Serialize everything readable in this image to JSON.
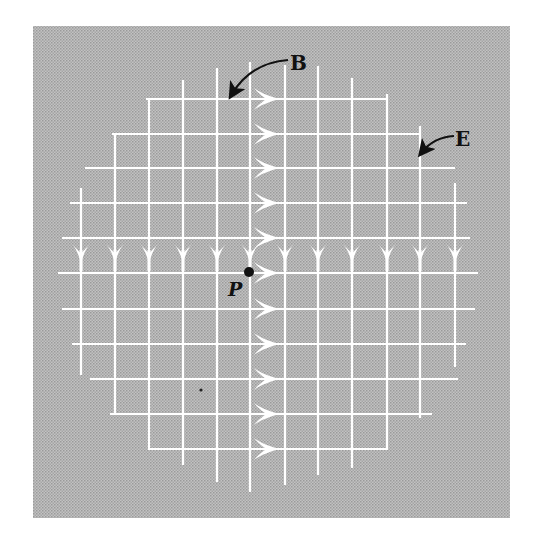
{
  "figure": {
    "background": "#b4b4b4",
    "grid_color": "#ffffff",
    "annotation_color": "#111111",
    "box": {
      "x": 33,
      "y": 26,
      "w": 477,
      "h": 492
    },
    "labels": {
      "magnetic_field": "B",
      "electric_field": "E",
      "point": "P"
    },
    "columns": [
      {
        "x": 81,
        "y1": 188,
        "y2": 375
      },
      {
        "x": 115,
        "y1": 135,
        "y2": 415
      },
      {
        "x": 149,
        "y1": 100,
        "y2": 450
      },
      {
        "x": 183,
        "y1": 80,
        "y2": 465
      },
      {
        "x": 217,
        "y1": 68,
        "y2": 482
      },
      {
        "x": 250,
        "y1": 62,
        "y2": 492
      },
      {
        "x": 285,
        "y1": 65,
        "y2": 485
      },
      {
        "x": 318,
        "y1": 66,
        "y2": 475
      },
      {
        "x": 352,
        "y1": 78,
        "y2": 468
      },
      {
        "x": 387,
        "y1": 94,
        "y2": 450
      },
      {
        "x": 420,
        "y1": 126,
        "y2": 418
      },
      {
        "x": 455,
        "y1": 183,
        "y2": 367
      }
    ],
    "rows": [
      {
        "y": 99,
        "x1": 146,
        "x2": 386
      },
      {
        "y": 134,
        "x1": 112,
        "x2": 421
      },
      {
        "y": 168,
        "x1": 85,
        "x2": 455
      },
      {
        "y": 203,
        "x1": 70,
        "x2": 467
      },
      {
        "y": 238,
        "x1": 62,
        "x2": 470
      },
      {
        "y": 273,
        "x1": 58,
        "x2": 478
      },
      {
        "y": 309,
        "x1": 62,
        "x2": 475
      },
      {
        "y": 344,
        "x1": 72,
        "x2": 466
      },
      {
        "y": 379,
        "x1": 90,
        "x2": 458
      },
      {
        "y": 414,
        "x1": 110,
        "x2": 432
      },
      {
        "y": 449,
        "x1": 150,
        "x2": 388
      }
    ],
    "right_arrows": {
      "base_x": 254,
      "tip_x": 280,
      "rows": [
        99,
        134,
        168,
        203,
        238,
        273,
        309,
        344,
        379,
        414,
        449
      ]
    },
    "down_arrows": {
      "top_y": 244,
      "tip_y": 263,
      "cols": [
        81,
        115,
        149,
        183,
        217,
        250,
        285,
        318,
        352,
        387,
        420,
        455
      ]
    },
    "point_P": {
      "x": 249,
      "y": 272,
      "r": 5,
      "label_x": 228,
      "label_y": 296
    },
    "stray_dot": {
      "x": 201,
      "y": 390,
      "r": 1.6
    },
    "label_B": {
      "x": 290,
      "y": 70,
      "arrow_path": "M 288 60 C 262 62, 244 74, 232 94"
    },
    "label_E": {
      "x": 455,
      "y": 146,
      "arrow_path": "M 454 136 C 440 137, 430 142, 422 152"
    }
  }
}
